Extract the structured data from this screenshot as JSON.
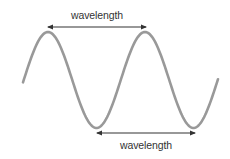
{
  "diagram": {
    "type": "wave-diagram",
    "wave_color": "#999999",
    "arrow_color": "#333333",
    "text_color": "#333333",
    "wave": {
      "start": [
        23,
        80
      ],
      "peaks": [
        [
          48,
          32
        ],
        [
          145,
          32
        ]
      ],
      "troughs": [
        [
          97,
          128
        ],
        [
          194,
          128
        ]
      ],
      "end": [
        218,
        80
      ]
    },
    "annotations": [
      {
        "id": "top",
        "label": "wavelength",
        "description": "crest to crest",
        "arrow": {
          "x1": 48,
          "x2": 146,
          "y": 27
        },
        "label_pos": {
          "x": 97,
          "y": 9
        }
      },
      {
        "id": "bottom",
        "label": "wavelength",
        "description": "trough to trough",
        "arrow": {
          "x1": 97,
          "x2": 195,
          "y": 133
        },
        "label_pos": {
          "x": 146,
          "y": 139
        }
      }
    ]
  }
}
